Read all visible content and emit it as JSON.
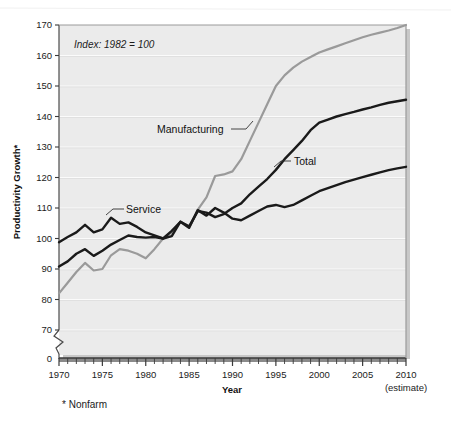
{
  "figure": {
    "background_color": "#ffffff",
    "plot_background_color": "#ebebeb",
    "gridline_color": "#ffffff",
    "frame_color": "#9a9a9a",
    "shadow_color": "#bdbdbd"
  },
  "annotation": {
    "index_note": "Index: 1982 = 100",
    "footnote": "* Nonfarm",
    "estimate_note": "(estimate)"
  },
  "labels": {
    "manufacturing": "Manufacturing",
    "total": "Total",
    "service": "Service"
  },
  "axes": {
    "y_title": "Productivity Growth*",
    "x_title": "Year",
    "y_ticks": [
      170,
      160,
      150,
      140,
      130,
      120,
      110,
      100,
      90,
      80,
      70
    ],
    "y_zero_tick": "0",
    "x_ticks_labeled": [
      1970,
      1975,
      1980,
      1985,
      1990,
      1995,
      2000,
      2005,
      2010
    ],
    "y_axis_break": true
  },
  "chart_data": {
    "type": "line",
    "title": "",
    "subtitle": "Index: 1982 = 100",
    "xlabel": "Year",
    "ylabel": "Productivity Growth*",
    "xlim": [
      1970,
      2010
    ],
    "ylim": [
      62,
      170
    ],
    "ybreak": [
      0,
      70
    ],
    "grid": true,
    "legend": "inline-annotations",
    "x": [
      1970,
      1971,
      1972,
      1973,
      1974,
      1975,
      1976,
      1977,
      1978,
      1979,
      1980,
      1981,
      1982,
      1983,
      1984,
      1985,
      1986,
      1987,
      1988,
      1989,
      1990,
      1991,
      1992,
      1993,
      1994,
      1995,
      1996,
      1997,
      1998,
      1999,
      2000,
      2001,
      2002,
      2003,
      2004,
      2005,
      2006,
      2007,
      2008,
      2009,
      2010
    ],
    "series": [
      {
        "name": "Manufacturing",
        "color": "#9a9a9a",
        "values": [
          82.0,
          85.5,
          89.0,
          92.0,
          89.5,
          90.0,
          94.5,
          96.5,
          96.0,
          95.0,
          93.5,
          96.5,
          100.0,
          102.0,
          105.5,
          103.5,
          109.5,
          113.5,
          120.5,
          121.0,
          122.0,
          126.0,
          132.0,
          138.0,
          144.0,
          150.0,
          153.5,
          156.0,
          158.0,
          159.5,
          161.0,
          162.0,
          163.0,
          164.0,
          165.0,
          166.0,
          166.8,
          167.5,
          168.2,
          169.0,
          170.0
        ]
      },
      {
        "name": "Total",
        "color": "#1a1a1a",
        "values": [
          90.8,
          92.5,
          95.0,
          96.5,
          94.3,
          96.0,
          98.0,
          99.5,
          101.0,
          100.5,
          100.3,
          100.5,
          100.0,
          102.5,
          105.5,
          104.0,
          109.0,
          108.5,
          107.0,
          108.0,
          110.0,
          111.5,
          114.5,
          117.0,
          119.5,
          122.5,
          126.0,
          129.0,
          132.0,
          135.5,
          138.0,
          139.0,
          140.0,
          140.8,
          141.5,
          142.3,
          143.0,
          143.8,
          144.5,
          145.0,
          145.5
        ]
      },
      {
        "name": "Service",
        "color": "#1a1a1a",
        "values": [
          98.8,
          100.5,
          102.0,
          104.5,
          102.0,
          103.0,
          106.8,
          104.8,
          105.3,
          103.8,
          102.0,
          101.0,
          100.0,
          100.8,
          105.5,
          103.5,
          109.3,
          107.5,
          110.0,
          108.5,
          106.5,
          106.0,
          107.5,
          109.0,
          110.5,
          111.0,
          110.3,
          111.0,
          112.5,
          114.0,
          115.5,
          116.5,
          117.5,
          118.5,
          119.3,
          120.1,
          120.9,
          121.7,
          122.4,
          123.0,
          123.5
        ]
      }
    ]
  }
}
